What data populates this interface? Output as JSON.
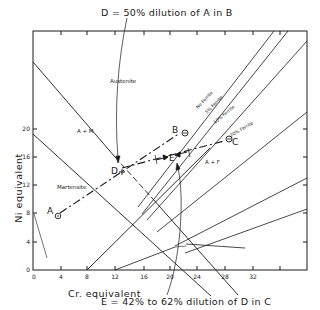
{
  "title_annotation": "D = 50% dilution of A in B",
  "bottom_annotation": "E = 42% to 62% dilution of D in C",
  "axes": {
    "xlabel": "Cr. equivalent",
    "ylabel": "Ni equivalent",
    "x_ticks": [
      "0",
      "4",
      "8",
      "12",
      "16",
      "20",
      "24",
      "28",
      "32"
    ],
    "y_ticks": [
      "0",
      "4",
      "8",
      "12",
      "16",
      "20"
    ]
  },
  "regions": {
    "austenite": "Austenite",
    "a_plus_m": "A + M",
    "martensite": "Martensite",
    "a_plus_f": "A + F"
  },
  "ferrite_lines": [
    {
      "label": "No Ferrite"
    },
    {
      "label": "5% Ferrite"
    },
    {
      "label": "10% Ferrite"
    },
    {
      "label": "20% Ferrite"
    }
  ],
  "points": {
    "A": {
      "label": "A",
      "cr": 3.5,
      "ni": 4
    },
    "B": {
      "label": "B",
      "cr": 23,
      "ni": 16
    },
    "C": {
      "label": "C",
      "cr": 29,
      "ni": 13.5
    },
    "D": {
      "label": "D",
      "cr": 12.7,
      "ni": 10
    },
    "E": {
      "label": "E",
      "cr": 20,
      "ni": 12
    }
  }
}
